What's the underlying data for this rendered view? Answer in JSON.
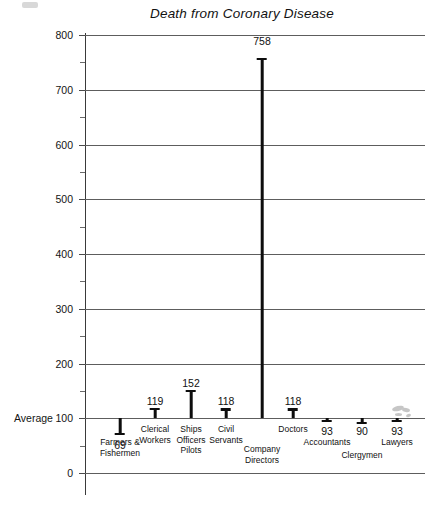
{
  "chart_data": {
    "type": "bar",
    "title": "Death from Coronary Disease",
    "xlabel": "",
    "ylabel": "",
    "ylim": [
      0,
      800
    ],
    "ytick_step": 100,
    "yticks": [
      "800",
      "700",
      "600",
      "500",
      "400",
      "300",
      "200",
      "100",
      "0"
    ],
    "minor_tick_step": 50,
    "grid": true,
    "legend": "none",
    "reference_line": {
      "label": "Average",
      "value": 100
    },
    "categories": [
      "Farmers & Fishermen",
      "Clerical Workers",
      "Ships Officers Pilots",
      "Civil Servants",
      "Company Directors",
      "Doctors",
      "Accountants",
      "Clergymen",
      "Lawyers"
    ],
    "values": [
      69,
      119,
      152,
      118,
      758,
      118,
      93,
      90,
      93
    ],
    "bars": [
      {
        "label": "Farmers &\nFishermen",
        "value": 69,
        "value_text": "69",
        "x": 120,
        "caption_top": 437,
        "value_top": 440,
        "value_below": true
      },
      {
        "label": "Clerical\nWorkers",
        "value": 119,
        "value_text": "119",
        "x": 155,
        "caption_top": 424,
        "value_top": 396,
        "value_below": false
      },
      {
        "label": "Ships\nOfficers\nPilots",
        "value": 152,
        "value_text": "152",
        "x": 191,
        "caption_top": 424,
        "value_top": 378,
        "value_below": false
      },
      {
        "label": "Civil\nServants",
        "value": 118,
        "value_text": "118",
        "x": 226,
        "caption_top": 424,
        "value_top": 396,
        "value_below": false
      },
      {
        "label": "Company\nDirectors",
        "value": 758,
        "value_text": "758",
        "x": 262,
        "caption_top": 444,
        "value_top": 36,
        "value_below": false
      },
      {
        "label": "Doctors",
        "value": 118,
        "value_text": "118",
        "x": 293,
        "caption_top": 424,
        "value_top": 396,
        "value_below": false
      },
      {
        "label": "Accountants",
        "value": 93,
        "value_text": "93",
        "x": 327,
        "caption_top": 437,
        "value_top": 426,
        "value_below": true
      },
      {
        "label": "Clergymen",
        "value": 90,
        "value_text": "90",
        "x": 362,
        "caption_top": 450,
        "value_top": 426,
        "value_below": true
      },
      {
        "label": "Lawyers",
        "value": 93,
        "value_text": "93",
        "x": 397,
        "caption_top": 437,
        "value_top": 426,
        "value_below": true
      }
    ]
  },
  "colors": {
    "bar": "#0d0d0d",
    "gridline": "#5d5d5d",
    "axis": "#3a3a3a",
    "text": "#141414",
    "background": "#ffffff"
  }
}
